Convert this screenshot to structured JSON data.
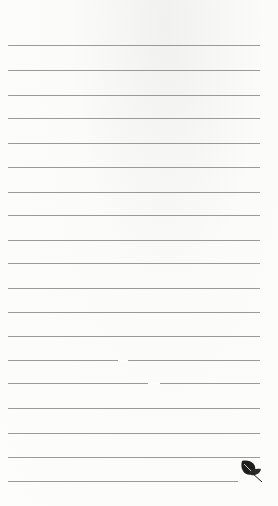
{
  "page": {
    "type": "lined-notepaper",
    "line_count": 19
  },
  "lines_y": [
    45,
    70,
    95,
    118,
    143,
    167,
    192,
    215,
    240,
    263,
    288,
    312,
    336,
    360,
    383,
    408,
    433,
    457,
    481
  ],
  "last_line_width": 230,
  "gaps": [
    {
      "y": 360,
      "x": 118,
      "w": 10
    },
    {
      "y": 383,
      "x": 148,
      "w": 12
    }
  ],
  "icons": {
    "corner": "leaf-icon"
  },
  "colors": {
    "line": "#9a9a9a",
    "paper": "#fbfbfa",
    "leaf": "#1e1e1e"
  }
}
